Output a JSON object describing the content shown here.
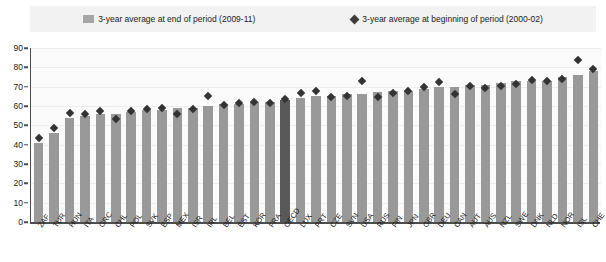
{
  "legend": {
    "series_end_label": "3-year average at end of period (2009-11)",
    "series_begin_label": "3-year average at beginning of period (2000-02)",
    "bar_swatch_color": "#a6a6a6",
    "marker_color": "#3d3d3d"
  },
  "axis": {
    "y_ticks": [
      "0",
      "10",
      "20",
      "30",
      "40",
      "50",
      "60",
      "70",
      "80",
      "90"
    ],
    "y_min": 0,
    "y_max": 90
  },
  "colors": {
    "bar": "#999999",
    "bar_highlight": "#595959",
    "marker": "#333333",
    "plot_background": "#fbfbfb",
    "legend_background": "#f2f2f2",
    "axis": "#4d4d4d"
  },
  "chart_data": {
    "type": "bar",
    "title": "",
    "subtitle": "",
    "xlabel": "",
    "ylabel": "",
    "ylim": [
      0,
      90
    ],
    "grid": true,
    "legend_position": "top",
    "highlight_category": "OECD",
    "categories": [
      "ZAF",
      "TUR",
      "HUN",
      "ITA",
      "GRC",
      "CHL",
      "POL",
      "SVK",
      "ESP",
      "MEX",
      "ISR",
      "IRL",
      "BEL",
      "EST",
      "KOR",
      "FRA",
      "OECD",
      "LUX",
      "PRT",
      "CZE",
      "SVN",
      "USA",
      "RUS",
      "FIN",
      "JPN",
      "GBR",
      "DEU",
      "CAN",
      "AUT",
      "AUS",
      "NZL",
      "SWE",
      "DNK",
      "NLD",
      "NOR",
      "ISL",
      "CHE"
    ],
    "series": [
      {
        "name": "3-year average at end of period (2009-11)",
        "type": "bar",
        "values": [
          41,
          46,
          54,
          55,
          56,
          56,
          57,
          58,
          58,
          59,
          59,
          60,
          61,
          61,
          62,
          62,
          63,
          64,
          65,
          65,
          66,
          66,
          67,
          68,
          68,
          69,
          70,
          70,
          71,
          71,
          72,
          73,
          73,
          73,
          75,
          76,
          78
        ]
      },
      {
        "name": "3-year average at beginning of period (2000-02)",
        "type": "scatter",
        "values": [
          43.5,
          48.5,
          56.5,
          56,
          57.5,
          53.5,
          57.5,
          58.5,
          59,
          56,
          58.5,
          65,
          60.5,
          61.5,
          62,
          61.5,
          63.5,
          66.5,
          68,
          64.5,
          65,
          73,
          64.5,
          66.5,
          68,
          70,
          72.5,
          66,
          70.5,
          69.5,
          70.5,
          71.5,
          73.5,
          73,
          74,
          84,
          79
        ]
      }
    ]
  }
}
